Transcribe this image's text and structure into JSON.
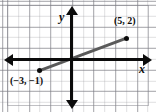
{
  "figure": {
    "type": "coordinate-plane-graph",
    "width": 156,
    "height": 112,
    "background_color": "#ffffff"
  },
  "axes": {
    "x_label": "x",
    "y_label": "y",
    "axis_color": "#0b0b0b",
    "x_arrows": "both",
    "y_arrows": "both",
    "origin_px": {
      "x": 72,
      "y": 60
    },
    "unit_px": 10.8
  },
  "grid": {
    "visible": true,
    "minor_color": "#96969b",
    "major_color": "#787880",
    "minor_spacing_units": 1,
    "major_spacing_units": 2
  },
  "chart_data": {
    "type": "scatter",
    "title": "",
    "xlabel": "x",
    "ylabel": "y",
    "xlim": [
      -6,
      7
    ],
    "ylim": [
      -4,
      4
    ],
    "grid": true,
    "legend": "none",
    "line_color": "#5a5a5a",
    "point_color": "#0b0b0b",
    "points": [
      {
        "id": "point-a",
        "x": 5,
        "y": 2,
        "label": "(5, 2)"
      },
      {
        "id": "point-b",
        "x": -3,
        "y": -1,
        "label": "(−3, −1)"
      }
    ],
    "series": [
      {
        "name": "line-through-points",
        "x": [
          -3,
          5
        ],
        "y": [
          -1,
          2
        ],
        "style": "solid",
        "slope": 0.375,
        "intercept": 0.125
      }
    ],
    "annotations": [
      {
        "text": "(5, 2)",
        "for": "point-a",
        "position": "above-left"
      },
      {
        "text": "(−3, −1)",
        "for": "point-b",
        "position": "below-left"
      }
    ]
  }
}
